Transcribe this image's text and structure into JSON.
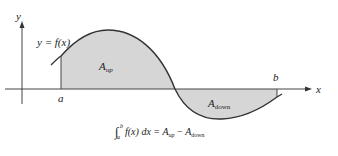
{
  "diagram": {
    "axis_labels": {
      "y": "y",
      "x": "x"
    },
    "curve_label": "y = f(x)",
    "bounds": {
      "a": "a",
      "b": "b"
    },
    "regions": [
      {
        "name": "A",
        "sub": "up",
        "fill": "#d6d6d6"
      },
      {
        "name": "A",
        "sub": "down",
        "fill": "#d6d6d6"
      }
    ],
    "formula": {
      "integral_lower": "a",
      "integral_upper": "b",
      "integrand": "f(x) dx = ",
      "a_up": "A",
      "a_up_sub": "up",
      "minus": " − ",
      "a_down": "A",
      "a_down_sub": "down"
    },
    "colors": {
      "line": "#333333",
      "fill": "#d6d6d6",
      "axis": "#444444"
    }
  }
}
